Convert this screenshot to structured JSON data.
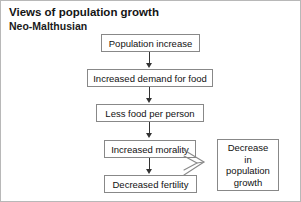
{
  "header": {
    "title": "Views of population growth",
    "subtitle": "Neo-Malthusian"
  },
  "diagram": {
    "type": "flowchart",
    "orientation": "vertical-chain-with-side-outcome",
    "nodes": [
      {
        "id": "population-increase",
        "label": "Population increase"
      },
      {
        "id": "increased-demand",
        "label": "Increased demand for food"
      },
      {
        "id": "less-food",
        "label": "Less food per person"
      },
      {
        "id": "increased-morality",
        "label": "Increased morality"
      },
      {
        "id": "decreased-fertility",
        "label": "Decreased fertility"
      }
    ],
    "outcome": {
      "id": "decrease-in-population-growth",
      "lines": [
        "Decrease",
        "in",
        "population",
        "growth"
      ],
      "label": "Decrease in population growth"
    },
    "connectors": [
      {
        "from": "population-increase",
        "to": "increased-demand",
        "style": "arrow-down"
      },
      {
        "from": "increased-demand",
        "to": "less-food",
        "style": "arrow-down"
      },
      {
        "from": "less-food",
        "to": "increased-morality",
        "style": "arrow-down"
      },
      {
        "from": "increased-morality",
        "to": "decreased-fertility",
        "style": "arrow-down"
      },
      {
        "from": "increased-morality",
        "to": "decrease-in-population-growth",
        "style": "block-arrow-right"
      },
      {
        "from": "decreased-fertility",
        "to": "decrease-in-population-growth",
        "style": "block-arrow-right"
      }
    ]
  },
  "colors": {
    "background": "#ffffff",
    "frame_border": "#b8b8b8",
    "node_border": "#888888",
    "connector": "#333333",
    "text": "#111111"
  }
}
